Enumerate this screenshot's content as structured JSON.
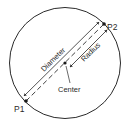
{
  "diagram": {
    "labels": {
      "p1": "P1",
      "p2": "P2",
      "center": "Center",
      "diameter": "Diameter",
      "radius": "Radius"
    },
    "colors": {
      "stroke": "#2a2a2a",
      "background": "#ffffff"
    }
  }
}
